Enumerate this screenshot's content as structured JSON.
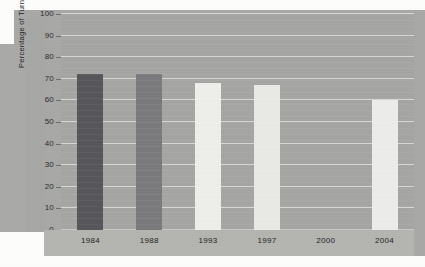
{
  "chart_data": {
    "type": "bar",
    "title": "",
    "xlabel": "",
    "ylabel": "Percentage of Turnout",
    "categories": [
      "1984",
      "1988",
      "1993",
      "1997",
      "2000",
      "2004"
    ],
    "values": [
      72,
      72,
      68,
      67,
      null,
      60
    ],
    "ylim": [
      0,
      100
    ],
    "ytick_labels": [
      "0",
      "10",
      "20",
      "30",
      "40",
      "50",
      "60",
      "70",
      "80",
      "90",
      "100"
    ],
    "ytick_values": [
      0,
      10,
      20,
      30,
      40,
      50,
      60,
      70,
      80,
      90,
      100
    ],
    "grid": true,
    "legend": false,
    "bar_colors": [
      "#55555a",
      "#7a7a7c",
      "#eeeeea",
      "#e9e9e5",
      "#00000000",
      "#ececea"
    ],
    "series": [
      {
        "name": "Turnout",
        "values": [
          72,
          72,
          68,
          67,
          null,
          60
        ]
      }
    ]
  },
  "style": {
    "plot_background": "#a5a5a3",
    "surround_background": "#a8a8a6",
    "page_background": "#fdfdfb",
    "gridline_color": "#d6d6d2",
    "axis_band_color": "#b4b4b1",
    "text_color": "#232323"
  }
}
